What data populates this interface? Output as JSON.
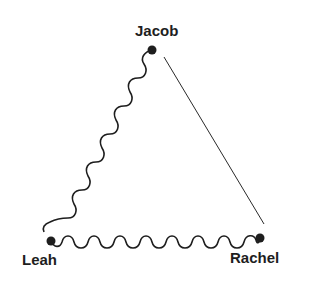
{
  "diagram": {
    "type": "relationship-triangle",
    "colors": {
      "ink": "#1e1e1e",
      "background": "#ffffff"
    },
    "nodes": [
      {
        "id": "jacob",
        "label": "Jacob",
        "x": 152,
        "y": 50
      },
      {
        "id": "leah",
        "label": "Leah",
        "x": 51,
        "y": 241
      },
      {
        "id": "rachel",
        "label": "Rachel",
        "x": 260,
        "y": 238
      }
    ],
    "edges": [
      {
        "from": "jacob",
        "to": "leah",
        "style": "wavy"
      },
      {
        "from": "leah",
        "to": "rachel",
        "style": "wavy"
      },
      {
        "from": "jacob",
        "to": "rachel",
        "style": "straight"
      }
    ]
  }
}
